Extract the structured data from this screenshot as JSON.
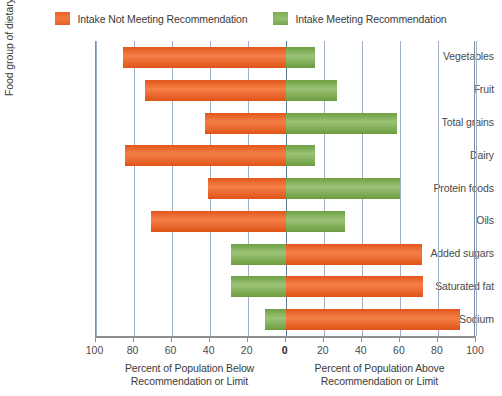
{
  "legend": {
    "entries": [
      {
        "label": "Intake Not Meeting Recommendation",
        "color": "#e8642a",
        "swatch": "orange"
      },
      {
        "label": "Intake Meeting Recommendation",
        "color": "#7cab52",
        "swatch": "green"
      }
    ]
  },
  "axes": {
    "y_title": "Food group of dietary component",
    "x_left_caption_line1": "Percent of Population Below",
    "x_left_caption_line2": "Recommendation or Limit",
    "x_right_caption_line1": "Percent of Population Above",
    "x_right_caption_line2": "Recommendation or Limit",
    "x_tick_labels": [
      "100",
      "80",
      "60",
      "40",
      "20",
      "0",
      "20",
      "40",
      "60",
      "80",
      "100"
    ]
  },
  "chart_data": {
    "type": "bar",
    "orientation": "horizontal",
    "subtype": "diverging-stacked",
    "title": "",
    "xlabel": "Percent of Population Below / Above Recommendation or Limit",
    "ylabel": "Food group of dietary component",
    "xlim": [
      -100,
      100
    ],
    "xticks": [
      -100,
      -80,
      -60,
      -40,
      -20,
      0,
      20,
      40,
      60,
      80,
      100
    ],
    "xtick_labels": [
      "100",
      "80",
      "60",
      "40",
      "20",
      "0",
      "20",
      "40",
      "60",
      "80",
      "100"
    ],
    "grid": true,
    "legend_position": "top",
    "categories": [
      "Vegetables",
      "Fruit",
      "Total grains",
      "Dairy",
      "Protein foods",
      "Oils",
      "Added sugars",
      "Saturated fat",
      "Sodium"
    ],
    "series": [
      {
        "name": "Intake Not Meeting Recommendation",
        "color": "#e8642a",
        "values": [
          85.6,
          74.2,
          42.3,
          84.7,
          40.8,
          71.0,
          71.4,
          72.3,
          91.6
        ]
      },
      {
        "name": "Intake Meeting Recommendation",
        "color": "#7cab52",
        "values": [
          15.6,
          27.0,
          58.3,
          15.6,
          60.0,
          31.0,
          29.0,
          28.6,
          10.7
        ]
      }
    ],
    "rows": [
      {
        "label": "Vegetables",
        "left_value": 85.6,
        "left_color": "#e8642a",
        "right_value": 15.6,
        "right_color": "#7cab52",
        "left_series": "Intake Not Meeting Recommendation",
        "right_series": "Intake Meeting Recommendation"
      },
      {
        "label": "Fruit",
        "left_value": 74.2,
        "left_color": "#e8642a",
        "right_value": 27.0,
        "right_color": "#7cab52",
        "left_series": "Intake Not Meeting Recommendation",
        "right_series": "Intake Meeting Recommendation"
      },
      {
        "label": "Total grains",
        "left_value": 42.3,
        "left_color": "#e8642a",
        "right_value": 58.3,
        "right_color": "#7cab52",
        "left_series": "Intake Not Meeting Recommendation",
        "right_series": "Intake Meeting Recommendation"
      },
      {
        "label": "Dairy",
        "left_value": 84.7,
        "left_color": "#e8642a",
        "right_value": 15.6,
        "right_color": "#7cab52",
        "left_series": "Intake Not Meeting Recommendation",
        "right_series": "Intake Meeting Recommendation"
      },
      {
        "label": "Protein foods",
        "left_value": 40.8,
        "left_color": "#e8642a",
        "right_value": 60.0,
        "right_color": "#7cab52",
        "left_series": "Intake Not Meeting Recommendation",
        "right_series": "Intake Meeting Recommendation"
      },
      {
        "label": "Oils",
        "left_value": 71.0,
        "left_color": "#e8642a",
        "right_value": 31.0,
        "right_color": "#7cab52",
        "left_series": "Intake Not Meeting Recommendation",
        "right_series": "Intake Meeting Recommendation"
      },
      {
        "label": "Added sugars",
        "left_value": 29.0,
        "left_color": "#7cab52",
        "right_value": 71.4,
        "right_color": "#e8642a",
        "left_series": "Intake Meeting Recommendation",
        "right_series": "Intake Not Meeting Recommendation"
      },
      {
        "label": "Saturated fat",
        "left_value": 28.6,
        "left_color": "#7cab52",
        "right_value": 72.3,
        "right_color": "#e8642a",
        "left_series": "Intake Meeting Recommendation",
        "right_series": "Intake Not Meeting Recommendation"
      },
      {
        "label": "Sodium",
        "left_value": 10.7,
        "left_color": "#7cab52",
        "right_value": 91.6,
        "right_color": "#e8642a",
        "left_series": "Intake Meeting Recommendation",
        "right_series": "Intake Not Meeting Recommendation"
      }
    ]
  }
}
